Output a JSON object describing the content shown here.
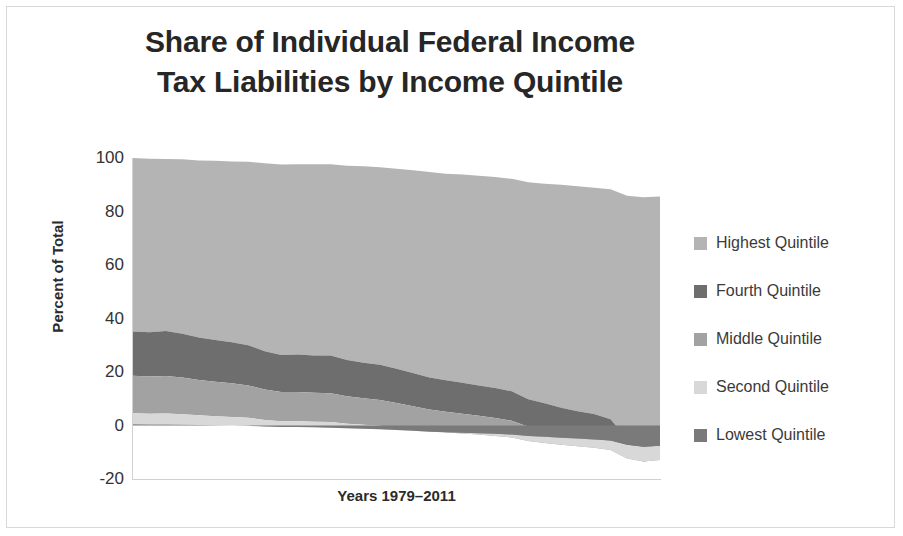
{
  "title": {
    "line1": "Share of Individual Federal Income",
    "line2": "Tax Liabilities by Income Quintile"
  },
  "axes": {
    "ylabel": "Percent of Total",
    "xlabel": "Years 1979–2011",
    "yticks": [
      "100",
      "80",
      "60",
      "40",
      "20",
      "0",
      "-20"
    ]
  },
  "legend": {
    "items": [
      {
        "label": "Highest Quintile",
        "color": "#b4b4b4"
      },
      {
        "label": "Fourth Quintile",
        "color": "#6e6e6e"
      },
      {
        "label": "Middle Quintile",
        "color": "#a2a2a2"
      },
      {
        "label": "Second Quintile",
        "color": "#d8d8d8"
      },
      {
        "label": "Lowest Quintile",
        "color": "#7a7a7a"
      }
    ]
  },
  "chart_data": {
    "type": "area",
    "title": "Share of Individual Federal Income Tax Liabilities by Income Quintile",
    "xlabel": "Years 1979–2011",
    "ylabel": "Percent of Total",
    "ylim": [
      -20,
      100
    ],
    "xlim": [
      1979,
      2011
    ],
    "grid": false,
    "legend_position": "right",
    "stacked": true,
    "note": "Stacked area of percent-of-total federal individual income tax liability by income quintile; bottom quintiles turn negative in later years due to refundable credits.",
    "x": [
      1979,
      1980,
      1981,
      1982,
      1983,
      1984,
      1985,
      1986,
      1987,
      1988,
      1989,
      1990,
      1991,
      1992,
      1993,
      1994,
      1995,
      1996,
      1997,
      1998,
      1999,
      2000,
      2001,
      2002,
      2003,
      2004,
      2005,
      2006,
      2007,
      2008,
      2009,
      2010,
      2011
    ],
    "series": [
      {
        "name": "Highest Quintile",
        "color": "#b4b4b4",
        "values": [
          64.9,
          64.8,
          64.3,
          65.2,
          66.2,
          67.0,
          67.6,
          68.6,
          70.2,
          71.2,
          71.2,
          71.5,
          71.5,
          72.6,
          73.4,
          73.8,
          74.8,
          75.8,
          76.9,
          77.2,
          77.8,
          78.4,
          78.9,
          79.4,
          81.1,
          82.1,
          83.4,
          84.1,
          84.6,
          86.0,
          91.0,
          92.9,
          92.0
        ]
      },
      {
        "name": "Fourth Quintile",
        "color": "#6e6e6e",
        "values": [
          16.5,
          16.6,
          16.8,
          16.4,
          15.9,
          15.6,
          15.3,
          15.0,
          14.3,
          13.9,
          14.0,
          14.0,
          14.1,
          13.6,
          13.3,
          13.2,
          12.8,
          12.4,
          11.9,
          11.8,
          11.6,
          11.4,
          11.2,
          11.0,
          10.3,
          10.0,
          9.5,
          9.2,
          9.0,
          8.5,
          6.6,
          5.9,
          6.2
        ]
      },
      {
        "name": "Middle Quintile",
        "color": "#a2a2a2",
        "values": [
          14.0,
          13.9,
          14.0,
          13.7,
          13.2,
          12.9,
          12.6,
          12.1,
          11.4,
          10.9,
          10.9,
          10.8,
          10.8,
          10.2,
          9.9,
          9.6,
          9.1,
          8.6,
          8.1,
          7.7,
          7.4,
          7.0,
          6.7,
          6.3,
          5.3,
          4.8,
          4.3,
          3.9,
          3.6,
          3.0,
          0.6,
          0.0,
          0.3
        ]
      },
      {
        "name": "Second Quintile",
        "color": "#d8d8d8",
        "values": [
          4.1,
          4.0,
          4.1,
          3.9,
          3.6,
          3.4,
          3.2,
          3.0,
          2.5,
          2.2,
          2.2,
          2.1,
          2.1,
          1.7,
          1.5,
          1.3,
          1.0,
          0.6,
          0.2,
          -0.1,
          -0.3,
          -0.5,
          -0.8,
          -1.1,
          -1.9,
          -2.3,
          -2.6,
          -2.9,
          -3.1,
          -3.6,
          -5.1,
          -5.6,
          -5.3
        ]
      },
      {
        "name": "Lowest Quintile",
        "color": "#7a7a7a",
        "values": [
          0.5,
          0.4,
          0.4,
          0.3,
          0.2,
          0.1,
          0.0,
          -0.1,
          -0.4,
          -0.6,
          -0.6,
          -0.7,
          -0.8,
          -1.0,
          -1.2,
          -1.4,
          -1.7,
          -2.0,
          -2.3,
          -2.5,
          -2.7,
          -2.9,
          -3.1,
          -3.4,
          -3.9,
          -4.2,
          -4.6,
          -4.9,
          -5.2,
          -5.6,
          -7.2,
          -7.9,
          -7.6
        ]
      }
    ]
  }
}
